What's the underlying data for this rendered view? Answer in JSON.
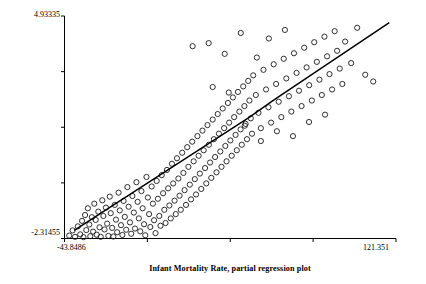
{
  "chart_data": {
    "type": "scatter",
    "title": "",
    "xlabel": "Infant Mortality Rate, partial regression plot",
    "ylabel": "Total Fertility Rate, partial regression plot",
    "xlim": [
      -43.8486,
      121.351
    ],
    "ylim": [
      -2.31455,
      4.93335
    ],
    "xtick_labels": [
      "-43.8486",
      "121.351"
    ],
    "ytick_labels": [
      "-2.31455",
      "4.93335"
    ],
    "n_xticks": 5,
    "n_yticks": 5,
    "grid": false,
    "legend": "none",
    "marker": "open-circle",
    "marker_color": "#1a1a1a",
    "line_color": "#000000",
    "fit_line": {
      "label": "regression line",
      "points": [
        [
          -39.0,
          -2.05
        ],
        [
          48.0,
          1.62
        ],
        [
          60.0,
          2.18
        ],
        [
          118.0,
          4.72
        ]
      ]
    },
    "points": [
      [
        -41.5,
        -2.22
      ],
      [
        -39.8,
        -2.05
      ],
      [
        -38.6,
        -2.26
      ],
      [
        -37.2,
        -1.92
      ],
      [
        -36.0,
        -2.18
      ],
      [
        -35.1,
        -1.74
      ],
      [
        -34.4,
        -2.27
      ],
      [
        -33.6,
        -1.55
      ],
      [
        -33.0,
        -2.04
      ],
      [
        -32.2,
        -1.33
      ],
      [
        -31.5,
        -1.86
      ],
      [
        -31.0,
        -2.24
      ],
      [
        -30.2,
        -1.62
      ],
      [
        -29.6,
        -2.09
      ],
      [
        -29.0,
        -1.18
      ],
      [
        -28.3,
        -1.71
      ],
      [
        -27.8,
        -2.19
      ],
      [
        -27.0,
        -1.44
      ],
      [
        -26.4,
        -1.95
      ],
      [
        -25.8,
        -2.26
      ],
      [
        -25.0,
        -1.07
      ],
      [
        -24.5,
        -1.58
      ],
      [
        -23.9,
        -2.02
      ],
      [
        -23.2,
        -1.31
      ],
      [
        -22.6,
        -1.83
      ],
      [
        -22.0,
        -2.23
      ],
      [
        -21.3,
        -0.95
      ],
      [
        -20.8,
        -1.49
      ],
      [
        -20.1,
        -1.97
      ],
      [
        -19.5,
        -2.25
      ],
      [
        -18.8,
        -1.22
      ],
      [
        -18.2,
        -1.7
      ],
      [
        -17.6,
        -2.11
      ],
      [
        -16.9,
        -0.82
      ],
      [
        -16.3,
        -1.4
      ],
      [
        -15.7,
        -1.88
      ],
      [
        -15.0,
        -2.2
      ],
      [
        -14.4,
        -1.09
      ],
      [
        -13.8,
        -1.61
      ],
      [
        -13.1,
        -2.03
      ],
      [
        -12.5,
        -0.64
      ],
      [
        -11.9,
        -1.28
      ],
      [
        -11.2,
        -1.79
      ],
      [
        -10.6,
        -2.16
      ],
      [
        -10.0,
        -0.93
      ],
      [
        -9.3,
        -1.47
      ],
      [
        -8.7,
        -1.99
      ],
      [
        -8.0,
        -0.48
      ],
      [
        -7.4,
        -1.12
      ],
      [
        -6.8,
        -1.66
      ],
      [
        -6.1,
        -2.08
      ],
      [
        -5.5,
        -0.77
      ],
      [
        -4.9,
        -1.33
      ],
      [
        -4.2,
        -1.85
      ],
      [
        -3.6,
        -2.21
      ],
      [
        -3.0,
        -0.31
      ],
      [
        -2.3,
        -0.98
      ],
      [
        -1.7,
        -1.52
      ],
      [
        -1.1,
        -1.94
      ],
      [
        -0.4,
        -0.62
      ],
      [
        0.2,
        -1.18
      ],
      [
        0.8,
        -1.72
      ],
      [
        1.5,
        -2.14
      ],
      [
        2.1,
        -0.44
      ],
      [
        2.7,
        -1.02
      ],
      [
        3.4,
        -1.58
      ],
      [
        4.0,
        -1.9
      ],
      [
        4.6,
        -0.25
      ],
      [
        5.3,
        -0.84
      ],
      [
        5.9,
        -1.38
      ],
      [
        6.5,
        -1.81
      ],
      [
        7.2,
        -0.08
      ],
      [
        7.8,
        -0.68
      ],
      [
        8.4,
        -1.24
      ],
      [
        9.1,
        -1.66
      ],
      [
        9.7,
        0.12
      ],
      [
        10.3,
        -0.52
      ],
      [
        11.0,
        -1.08
      ],
      [
        11.6,
        -1.52
      ],
      [
        12.2,
        0.3
      ],
      [
        12.9,
        -0.36
      ],
      [
        13.5,
        -0.92
      ],
      [
        14.1,
        -1.38
      ],
      [
        14.8,
        0.48
      ],
      [
        15.4,
        -0.18
      ],
      [
        16.0,
        -0.74
      ],
      [
        16.7,
        -1.22
      ],
      [
        17.3,
        0.66
      ],
      [
        17.9,
        0.02
      ],
      [
        18.6,
        -0.56
      ],
      [
        19.2,
        -1.04
      ],
      [
        19.8,
        0.84
      ],
      [
        20.5,
        0.2
      ],
      [
        21.1,
        -0.38
      ],
      [
        21.7,
        -0.88
      ],
      [
        22.4,
        1.02
      ],
      [
        23.0,
        0.38
      ],
      [
        23.6,
        -0.2
      ],
      [
        24.3,
        -0.7
      ],
      [
        24.9,
        1.2
      ],
      [
        25.5,
        0.56
      ],
      [
        26.2,
        -0.02
      ],
      [
        26.8,
        -0.52
      ],
      [
        27.4,
        1.38
      ],
      [
        28.1,
        0.74
      ],
      [
        28.7,
        0.16
      ],
      [
        29.3,
        -0.34
      ],
      [
        30.0,
        1.56
      ],
      [
        30.6,
        0.92
      ],
      [
        31.2,
        0.34
      ],
      [
        31.9,
        -0.16
      ],
      [
        32.5,
        1.74
      ],
      [
        33.1,
        1.1
      ],
      [
        33.8,
        0.52
      ],
      [
        34.4,
        0.02
      ],
      [
        35.0,
        1.92
      ],
      [
        35.7,
        1.28
      ],
      [
        36.3,
        0.7
      ],
      [
        36.9,
        0.2
      ],
      [
        37.6,
        2.1
      ],
      [
        38.2,
        1.46
      ],
      [
        38.8,
        0.88
      ],
      [
        39.5,
        0.38
      ],
      [
        40.1,
        2.28
      ],
      [
        40.7,
        1.64
      ],
      [
        41.4,
        1.06
      ],
      [
        42.0,
        0.56
      ],
      [
        42.6,
        2.46
      ],
      [
        43.3,
        1.82
      ],
      [
        43.9,
        1.24
      ],
      [
        44.5,
        0.74
      ],
      [
        45.2,
        2.64
      ],
      [
        45.8,
        2.0
      ],
      [
        46.4,
        1.42
      ],
      [
        47.1,
        0.92
      ],
      [
        47.7,
        2.82
      ],
      [
        48.3,
        2.18
      ],
      [
        49.0,
        1.6
      ],
      [
        49.6,
        1.1
      ],
      [
        50.2,
        3.0
      ],
      [
        51.5,
        2.36
      ],
      [
        52.8,
        1.78
      ],
      [
        54.0,
        1.28
      ],
      [
        55.3,
        3.18
      ],
      [
        56.6,
        2.54
      ],
      [
        57.8,
        1.96
      ],
      [
        59.1,
        1.46
      ],
      [
        60.4,
        3.36
      ],
      [
        61.6,
        2.72
      ],
      [
        62.9,
        2.14
      ],
      [
        64.2,
        1.64
      ],
      [
        65.4,
        3.54
      ],
      [
        66.7,
        2.9
      ],
      [
        68.0,
        2.32
      ],
      [
        69.2,
        1.82
      ],
      [
        70.5,
        3.72
      ],
      [
        71.8,
        3.08
      ],
      [
        73.0,
        2.5
      ],
      [
        74.3,
        2.0
      ],
      [
        75.6,
        3.9
      ],
      [
        76.8,
        3.26
      ],
      [
        78.1,
        2.68
      ],
      [
        79.4,
        2.18
      ],
      [
        80.6,
        4.08
      ],
      [
        81.9,
        3.44
      ],
      [
        83.2,
        2.86
      ],
      [
        84.4,
        2.36
      ],
      [
        85.7,
        4.26
      ],
      [
        87.0,
        3.62
      ],
      [
        88.2,
        3.04
      ],
      [
        89.5,
        2.54
      ],
      [
        90.8,
        4.44
      ],
      [
        92.0,
        3.8
      ],
      [
        93.3,
        3.22
      ],
      [
        94.6,
        2.72
      ],
      [
        96.0,
        4.1
      ],
      [
        99.0,
        3.4
      ],
      [
        102.0,
        4.55
      ],
      [
        106.0,
        3.02
      ],
      [
        110.0,
        2.8
      ],
      [
        20.0,
        3.95
      ],
      [
        28.0,
        4.05
      ],
      [
        36.0,
        3.7
      ],
      [
        44.0,
        4.38
      ],
      [
        52.0,
        3.58
      ],
      [
        58.0,
        4.2
      ],
      [
        66.0,
        4.48
      ],
      [
        30.0,
        2.62
      ],
      [
        38.0,
        2.44
      ],
      [
        46.0,
        1.36
      ],
      [
        54.0,
        0.86
      ],
      [
        62.0,
        1.18
      ],
      [
        70.0,
        1.02
      ],
      [
        78.0,
        1.48
      ],
      [
        86.0,
        1.72
      ]
    ]
  }
}
